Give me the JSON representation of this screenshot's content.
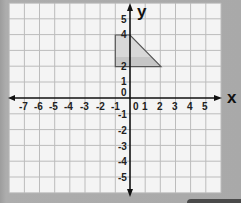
{
  "diagram": {
    "type": "coordinate-grid",
    "x_axis": {
      "label": "x",
      "min": -8,
      "max": 6,
      "tick_labels": [
        "-7",
        "-6",
        "-5",
        "-4",
        "-3",
        "-2",
        "-1",
        "0",
        "1",
        "2",
        "3",
        "4",
        "5"
      ]
    },
    "y_axis": {
      "label": "y",
      "min": -6,
      "max": 6,
      "tick_labels_positive": [
        "0",
        "1",
        "2",
        "4",
        "5"
      ],
      "tick_labels_negative": [
        "-1",
        "-2",
        "-3",
        "-4",
        "-5"
      ]
    },
    "shape": {
      "name": "trapezium",
      "vertices": [
        [
          -1,
          4
        ],
        [
          0,
          4
        ],
        [
          2,
          2
        ],
        [
          -1,
          2
        ]
      ],
      "fill": "#d6d6d6",
      "fill_band": "#c4c4c4",
      "stroke": "#555555"
    },
    "colors": {
      "background": "#a9a9a9",
      "paper": "#f4f4f4",
      "gridline": "#bcbcbc",
      "axis": "#111111"
    }
  }
}
